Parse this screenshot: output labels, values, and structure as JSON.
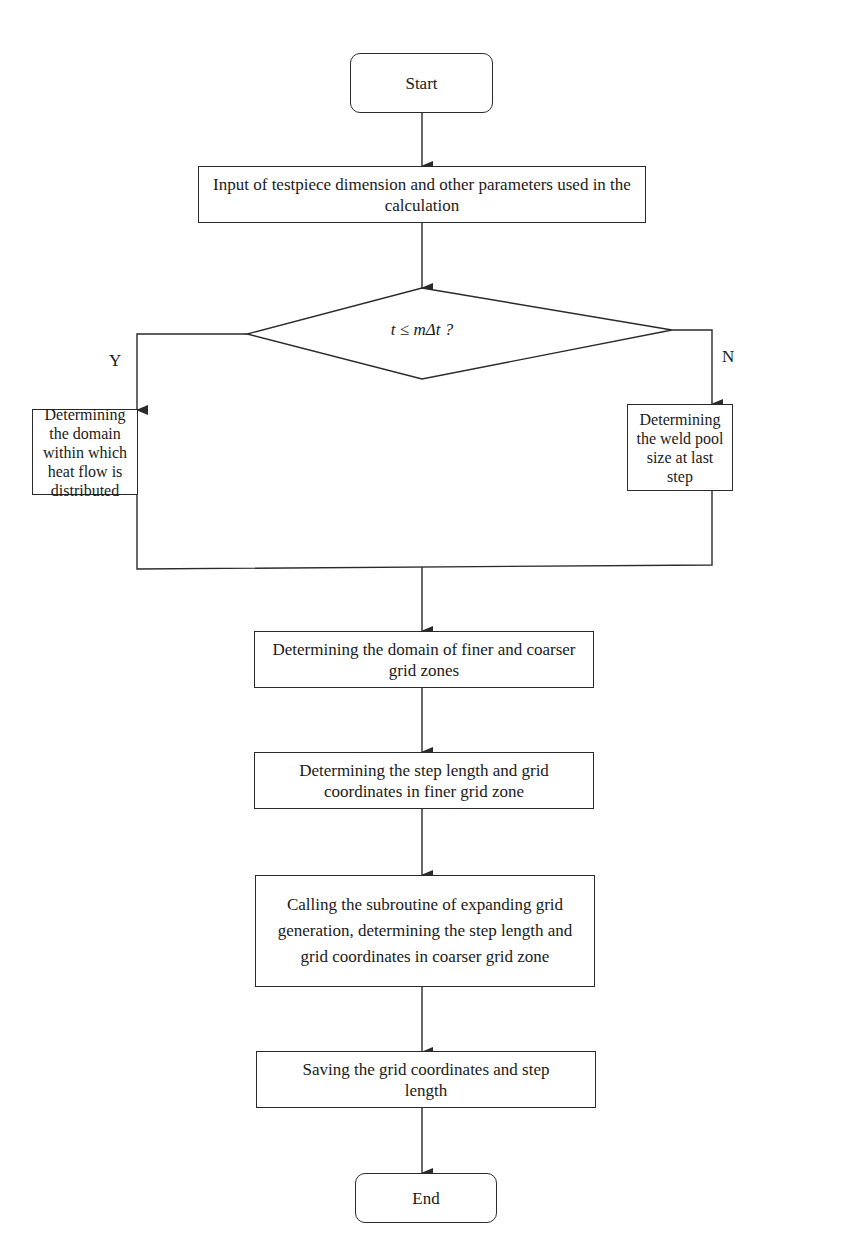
{
  "diagram": {
    "type": "flowchart",
    "nodes": {
      "start": "Start",
      "input": "Input of testpiece dimension and other parameters used in the calculation",
      "decision": "t ≤ mΔt ?",
      "yes_branch": "Determining the domain within which heat flow is distributed",
      "no_branch": "Determining the weld pool size at last step",
      "domain_zones": "Determining the domain of finer and coarser grid zones",
      "finer_grid": "Determining the step length and grid coordinates in finer grid zone",
      "coarser_grid": "Calling the subroutine of expanding grid generation, determining the step length and grid coordinates in coarser grid zone",
      "save": "Saving the grid coordinates and step length",
      "end": "End"
    },
    "branch_labels": {
      "yes": "Y",
      "no": "N"
    },
    "line_color": "#2a2a2a"
  }
}
